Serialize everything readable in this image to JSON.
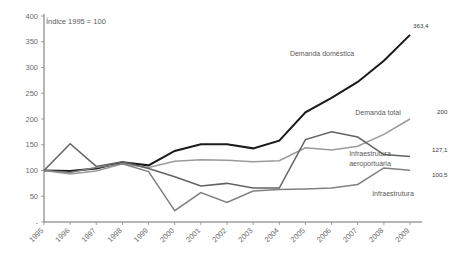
{
  "chart_data": {
    "type": "line",
    "title": "",
    "note": "Índice 1995 = 100",
    "xlabel": "",
    "ylabel": "",
    "ylim": [
      0,
      400
    ],
    "yticks": [
      "-",
      "50",
      "100",
      "150",
      "200",
      "250",
      "300",
      "350",
      "400"
    ],
    "ytick_values": [
      0,
      50,
      100,
      150,
      200,
      250,
      300,
      350,
      400
    ],
    "grid": false,
    "legend_position": "inline-annotations",
    "categories": [
      "1995",
      "1996",
      "1997",
      "1998",
      "1999",
      "2000",
      "2001",
      "2002",
      "2003",
      "2004",
      "2005",
      "2006",
      "2007",
      "2008",
      "2009"
    ],
    "series": [
      {
        "name": "Demanda doméstica",
        "color": "#1a1a1a",
        "width": 2.0,
        "end_label": "363,4",
        "values": [
          100,
          99,
          104,
          116,
          110,
          138,
          151,
          151,
          143,
          158,
          213,
          241,
          272,
          313,
          363.4
        ]
      },
      {
        "name": "Demanda total",
        "color": "#9a9a9a",
        "width": 1.5,
        "end_label": "200",
        "values": [
          100,
          93,
          99,
          113,
          106,
          118,
          121,
          120,
          117,
          119,
          144,
          140,
          147,
          170,
          200
        ]
      },
      {
        "name": "Infraestrutura aeroportuária",
        "color": "#636363",
        "width": 1.5,
        "end_label": "127,1",
        "values": [
          100,
          152,
          108,
          117,
          104,
          88,
          70,
          75,
          66,
          66,
          160,
          175,
          165,
          131,
          127.1
        ]
      },
      {
        "name": "Infraestrutura",
        "color": "#808080",
        "width": 1.5,
        "end_label": "100,5",
        "values": [
          100,
          96,
          106,
          113,
          98,
          22,
          57,
          38,
          60,
          63,
          64,
          66,
          73,
          105,
          100.5
        ]
      }
    ],
    "annotations": [
      {
        "name": "demanda-domestica",
        "text": "Demanda doméstica",
        "x": 322,
        "y": 56
      },
      {
        "name": "demanda-total",
        "text": "Demanda total",
        "x": 378,
        "y": 115
      },
      {
        "name": "infraestrutura-aeroportuaria-line1",
        "text": "Infraestrutura",
        "x": 370,
        "y": 156
      },
      {
        "name": "infraestrutura-aeroportuaria-line2",
        "text": "aeroportuária",
        "x": 370,
        "y": 166
      },
      {
        "name": "infraestrutura",
        "text": "Infraestrutura",
        "x": 393,
        "y": 196
      }
    ],
    "value_labels": [
      {
        "name": "label-363-4",
        "text": "363,4",
        "x": 413,
        "y": 28
      },
      {
        "name": "label-200",
        "text": "200",
        "x": 437,
        "y": 114
      },
      {
        "name": "label-127-1",
        "text": "127,1",
        "x": 432,
        "y": 152
      },
      {
        "name": "label-100-5",
        "text": "100,5",
        "x": 432,
        "y": 177
      }
    ]
  }
}
